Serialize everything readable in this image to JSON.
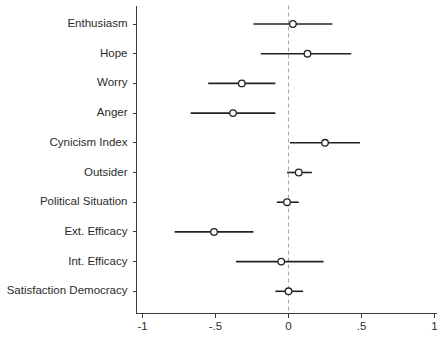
{
  "chart_data": {
    "type": "scatter",
    "title": "",
    "subtitle": "",
    "xlabel": "",
    "ylabel": "",
    "xlim": [
      -1,
      1
    ],
    "grid": false,
    "legend": null,
    "reference_line": {
      "value": 0,
      "style": "dashed",
      "color": "#a8a8a8"
    },
    "xticks": [
      -1,
      -0.5,
      0,
      0.5,
      1
    ],
    "xticklabels": [
      "-1",
      "-.5",
      "0",
      ".5",
      "1"
    ],
    "categories": [
      "Enthusiasm",
      "Hope",
      "Worry",
      "Anger",
      "Cynicism Index",
      "Outsider",
      "Political Situation",
      "Ext. Efficacy",
      "Int. Efficacy",
      "Satisfaction Democracy"
    ],
    "estimates": [
      0.03,
      0.13,
      -0.32,
      -0.38,
      0.25,
      0.07,
      -0.01,
      -0.51,
      -0.05,
      0.0
    ],
    "ci_low": [
      -0.24,
      -0.19,
      -0.55,
      -0.67,
      0.01,
      -0.01,
      -0.08,
      -0.78,
      -0.36,
      -0.09
    ],
    "ci_high": [
      0.3,
      0.43,
      -0.09,
      -0.09,
      0.49,
      0.16,
      0.07,
      -0.24,
      0.24,
      0.1
    ],
    "marker": "open-circle",
    "marker_color": "#ffffff",
    "marker_edge_color": "#222222",
    "line_color": "#222222"
  }
}
